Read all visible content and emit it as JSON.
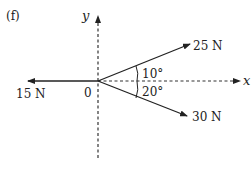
{
  "figure": {
    "label": "(f)",
    "axes": {
      "x_label": "x",
      "y_label": "y",
      "origin_label": "0"
    },
    "forces": [
      {
        "magnitude_label": "25 N",
        "angle_label": "10°",
        "angle_deg": 10,
        "direction": "above +x"
      },
      {
        "magnitude_label": "30 N",
        "angle_label": "20°",
        "angle_deg": -20,
        "direction": "below +x"
      },
      {
        "magnitude_label": "15 N",
        "angle_deg": 180,
        "direction": "along -x"
      }
    ]
  }
}
